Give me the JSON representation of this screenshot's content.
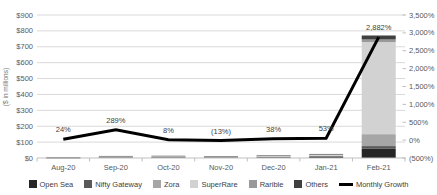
{
  "page": {
    "background": "#ffffff"
  },
  "chart_data": {
    "type": "combo-stacked-bar-line",
    "title": "",
    "grid": true,
    "legend_position": "bottom",
    "categories": [
      "Aug-20",
      "Sep-20",
      "Oct-20",
      "Nov-20",
      "Dec-20",
      "Jan-21",
      "Feb-21"
    ],
    "bar_series": [
      {
        "name": "Open Sea",
        "color": "#262626",
        "values": [
          0.8,
          3.2,
          3.5,
          3.0,
          4.2,
          6.4,
          60
        ]
      },
      {
        "name": "Nifty Gateway",
        "color": "#595959",
        "values": [
          0.7,
          2.6,
          2.8,
          2.4,
          3.3,
          5.1,
          15
        ]
      },
      {
        "name": "Zora",
        "color": "#a6a6a6",
        "values": [
          0.3,
          1.0,
          1.1,
          1.0,
          1.3,
          2.0,
          75
        ]
      },
      {
        "name": "SuperRare",
        "color": "#d2d2d2",
        "values": [
          0.7,
          2.6,
          2.8,
          2.4,
          3.4,
          5.0,
          580
        ]
      },
      {
        "name": "Rarible",
        "color": "#999999",
        "values": [
          0.6,
          2.5,
          2.7,
          2.3,
          3.2,
          5.0,
          16
        ]
      },
      {
        "name": "Others",
        "color": "#404040",
        "values": [
          0.2,
          1.0,
          1.0,
          1.0,
          1.3,
          2.0,
          25
        ]
      }
    ],
    "bar_totals": [
      3.3,
      12.9,
      13.9,
      12.1,
      16.7,
      25.5,
      771
    ],
    "line_series": {
      "name": "Monthly Growth",
      "color": "#000000",
      "values_pct": [
        24,
        289,
        8,
        -13,
        38,
        53,
        2882
      ],
      "labels": [
        "24%",
        "289%",
        "8%",
        "(13%)",
        "38%",
        "53%",
        "2,882%"
      ]
    },
    "left_axis": {
      "title": "($ in millions)",
      "min": 0,
      "max": 900,
      "step": 100,
      "ticks": [
        {
          "label": "$0",
          "value": 0
        },
        {
          "label": "$100",
          "value": 100
        },
        {
          "label": "$200",
          "value": 200
        },
        {
          "label": "$300",
          "value": 300
        },
        {
          "label": "$400",
          "value": 400
        },
        {
          "label": "$500",
          "value": 500
        },
        {
          "label": "$600",
          "value": 600
        },
        {
          "label": "$700",
          "value": 700
        },
        {
          "label": "$800",
          "value": 800
        },
        {
          "label": "$900",
          "value": 900
        }
      ]
    },
    "right_axis": {
      "min": -500,
      "max": 3500,
      "step": 500,
      "ticks": [
        {
          "label": "(500%)",
          "value": -500
        },
        {
          "label": "0%",
          "value": 0
        },
        {
          "label": "500%",
          "value": 500
        },
        {
          "label": "1,000%",
          "value": 1000
        },
        {
          "label": "1,500%",
          "value": 1500
        },
        {
          "label": "2,000%",
          "value": 2000
        },
        {
          "label": "2,500%",
          "value": 2500
        },
        {
          "label": "3,000%",
          "value": 3000
        },
        {
          "label": "3,500%",
          "value": 3500
        }
      ]
    },
    "colors": {
      "gridline": "#d9d9d9",
      "axis": "#bfbfbf",
      "tick_label": "#595959",
      "growth_label": "#404040"
    }
  }
}
